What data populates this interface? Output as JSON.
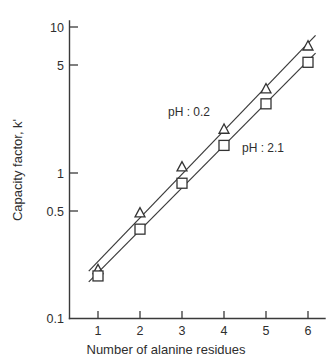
{
  "chart_data": {
    "type": "scatter",
    "title": "",
    "xlabel": "Number of alanine residues",
    "ylabel": "Capacity factor, k'",
    "x": [
      1,
      2,
      3,
      4,
      5,
      6
    ],
    "xlim": [
      0.6,
      6.45
    ],
    "ylim": [
      0.1,
      13
    ],
    "yscale": "log",
    "xticks": [
      "1",
      "2",
      "3",
      "4",
      "5",
      "6"
    ],
    "yticks": [
      "10",
      "5",
      "1",
      "0.5",
      "0.1"
    ],
    "ytick_values": [
      10,
      5,
      1,
      0.5,
      0.1
    ],
    "grid": false,
    "legend_position": "inline-annotation",
    "series": [
      {
        "name": "pH : 0.2",
        "marker": "triangle-up-open",
        "values": [
          0.215,
          0.53,
          1.1,
          2.0,
          3.8,
          7.5
        ]
      },
      {
        "name": "pH : 2.1",
        "marker": "square-open",
        "values": [
          0.195,
          0.41,
          0.85,
          1.55,
          3.0,
          5.8
        ]
      }
    ],
    "annotations": [
      {
        "text": "pH : 0.2",
        "x_px": 168,
        "y_px": 116
      },
      {
        "text": "pH : 2.1",
        "x_px": 242,
        "y_px": 152
      }
    ]
  },
  "axes": {
    "y_title": "Capacity factor, k'",
    "x_title": "Number of alanine residues",
    "y_tick_labels": [
      "10",
      "5",
      "1",
      "0.5",
      "0.1"
    ],
    "x_tick_labels": [
      "1",
      "2",
      "3",
      "4",
      "5",
      "6"
    ]
  },
  "colors": {
    "background": "#ffffff",
    "axis": "#3a3a3a",
    "text": "#2e2e2e",
    "marker_stroke": "#333333",
    "marker_fill": "#ffffff"
  }
}
